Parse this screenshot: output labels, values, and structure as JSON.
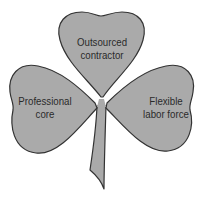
{
  "diagram": {
    "type": "shamrock-organization",
    "colors": {
      "leaf_fill": "#aaaaaa",
      "leaf_stroke": "#333333",
      "text": "#2a2a2a",
      "background": "#ffffff"
    },
    "leaves": [
      {
        "position": "top",
        "label_line1": "Outsourced",
        "label_line2": "contractor"
      },
      {
        "position": "left",
        "label_line1": "Professional",
        "label_line2": "core"
      },
      {
        "position": "right",
        "label_line1": "Flexible",
        "label_line2": "labor force"
      }
    ]
  }
}
